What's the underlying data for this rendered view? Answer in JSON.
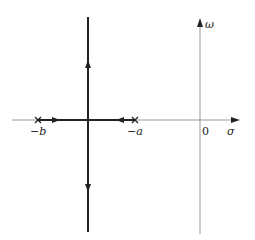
{
  "diagram": {
    "type": "root-locus",
    "axes": {
      "real_label": "σ",
      "imag_label": "ω",
      "origin_label": "0"
    },
    "poles": [
      {
        "label": "−b",
        "marker": "x"
      },
      {
        "label": "−a",
        "marker": "x"
      }
    ],
    "branches": [
      {
        "description": "real-axis segment from −b toward breakaway point",
        "direction": "right"
      },
      {
        "description": "real-axis segment from −a toward breakaway point",
        "direction": "left"
      },
      {
        "description": "vertical branch upward from breakaway point",
        "direction": "up"
      },
      {
        "description": "vertical branch downward from breakaway point",
        "direction": "down"
      }
    ],
    "colors": {
      "axis": "#9a9a9a",
      "locus": "#222222"
    }
  }
}
